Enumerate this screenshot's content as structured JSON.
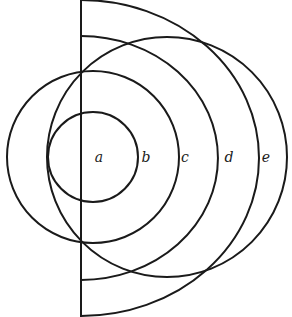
{
  "figure": {
    "type": "geometric-diagram",
    "stroke_color": "#1a1a1a",
    "background": "#ffffff",
    "labels": [
      {
        "id": "a",
        "text": "a",
        "x": 99,
        "y": 162
      },
      {
        "id": "b",
        "text": "b",
        "x": 146,
        "y": 162
      },
      {
        "id": "c",
        "text": "c",
        "x": 185,
        "y": 162
      },
      {
        "id": "d",
        "text": "d",
        "x": 229,
        "y": 162
      },
      {
        "id": "e",
        "text": "e",
        "x": 266,
        "y": 162
      }
    ],
    "shapes": {
      "vertical_line": {
        "x": 81,
        "y1": 0,
        "y2": 317
      },
      "circle_a": {
        "cx": 93,
        "cy": 157,
        "r": 45
      },
      "circle_b": {
        "cx": 93,
        "cy": 157,
        "r": 86
      },
      "circle_e": {
        "cx": 167,
        "cy": 157,
        "r": 120
      },
      "arc_c": {
        "cx": 81,
        "cy": 158,
        "rx": 137,
        "ry": 122
      },
      "arc_d": {
        "cx": 81,
        "cy": 158,
        "rx": 178,
        "ry": 158
      }
    }
  }
}
